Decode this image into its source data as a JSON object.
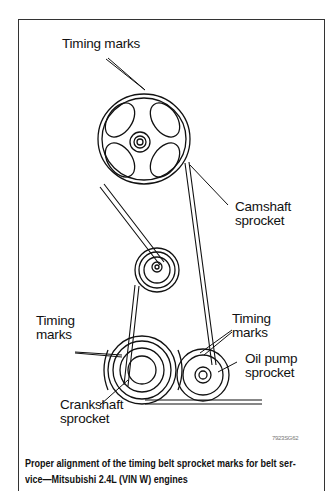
{
  "figure": {
    "labels": {
      "timing_marks_top": "Timing marks",
      "camshaft_line1": "Camshaft",
      "camshaft_line2": "sprocket",
      "timing_marks_left_line1": "Timing",
      "timing_marks_left_line2": "marks",
      "timing_marks_right_line1": "Timing",
      "timing_marks_right_line2": "marks",
      "oil_pump_line1": "Oil pump",
      "oil_pump_line2": "sprocket",
      "crankshaft_line1": "Crankshaft",
      "crankshaft_line2": "sprocket"
    },
    "figure_id": "7923SG62",
    "caption_line1": "Proper alignment of the timing belt sprocket marks for belt ser-",
    "caption_line2": "vice—Mitsubishi 2.4L (VIN W) engines"
  }
}
